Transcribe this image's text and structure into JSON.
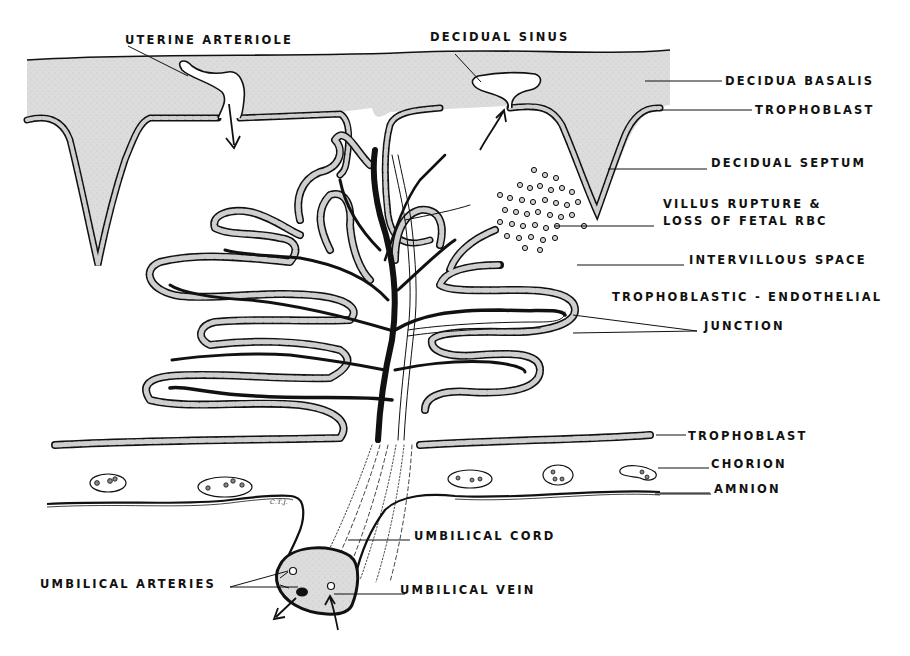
{
  "figure": {
    "labels": {
      "uterine_arteriole": "UTERINE ARTERIOLE",
      "decidual_sinus": "DECIDUAL SINUS",
      "decidua_basalis": "DECIDUA BASALIS",
      "trophoblast_top": "TROPHOBLAST",
      "decidual_septum": "DECIDUAL SEPTUM",
      "villus_rupture_line1": "VILLUS RUPTURE &",
      "villus_rupture_line2": "LOSS OF FETAL RBC",
      "intervillous_space": "INTERVILLOUS SPACE",
      "tj_line1": "TROPHOBLASTIC - ENDOTHELIAL",
      "tj_line2": "JUNCTION",
      "trophoblast_bottom": "TROPHOBLAST",
      "chorion": "CHORION",
      "amnion": "AMNION",
      "umbilical_cord": "UMBILICAL CORD",
      "umbilical_arteries": "UMBILICAL ARTERIES",
      "umbilical_vein": "UMBILICAL VEIN"
    },
    "artist_initials": "C.T.J.",
    "caption_partial": "",
    "colors": {
      "ink": "#111111",
      "decidua_fill": "#d9d9d9",
      "cell_fill": "#cfcfcf",
      "background": "#ffffff"
    }
  }
}
